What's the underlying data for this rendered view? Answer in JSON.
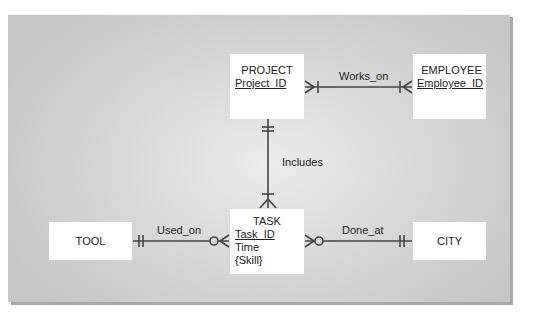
{
  "diagram": {
    "type": "entity-relationship (crow's foot)",
    "entities": [
      {
        "id": "project",
        "name": "PROJECT",
        "attributes": [
          {
            "text": "Project_ID",
            "key": true
          }
        ]
      },
      {
        "id": "employee",
        "name": "EMPLOYEE",
        "attributes": [
          {
            "text": "Employee_ID",
            "key": true
          }
        ]
      },
      {
        "id": "task",
        "name": "TASK",
        "attributes": [
          {
            "text": "Task_ID",
            "key": true
          },
          {
            "text": "Time",
            "key": false
          },
          {
            "text": "{Skill}",
            "key": false
          }
        ]
      },
      {
        "id": "tool",
        "name": "TOOL",
        "attributes": []
      },
      {
        "id": "city",
        "name": "CITY",
        "attributes": []
      }
    ],
    "relationships": [
      {
        "label": "Works_on",
        "from": "PROJECT",
        "to": "EMPLOYEE",
        "from_cardinality": "one-or-many",
        "to_cardinality": "one-or-many"
      },
      {
        "label": "Includes",
        "from": "PROJECT",
        "to": "TASK",
        "from_cardinality": "exactly-one",
        "to_cardinality": "one-or-many"
      },
      {
        "label": "Used_on",
        "from": "TOOL",
        "to": "TASK",
        "from_cardinality": "exactly-one",
        "to_cardinality": "zero-or-many"
      },
      {
        "label": "Done_at",
        "from": "TASK",
        "to": "CITY",
        "from_cardinality": "zero-or-many",
        "to_cardinality": "exactly-one"
      }
    ]
  },
  "colors": {
    "line": "#444444",
    "entity_fill": "#ffffff",
    "panel": "#d6d6d6"
  }
}
